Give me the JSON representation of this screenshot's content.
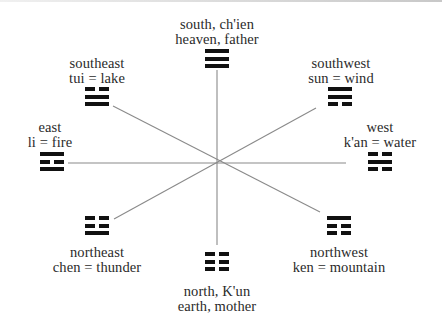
{
  "diagram": {
    "title": "",
    "center": {
      "x": 217,
      "y": 163
    },
    "line_color": "#8a8a8a",
    "trigram_color": "#111111",
    "directions": [
      {
        "id": "south",
        "line1": "south,  ch'ien",
        "line2": "heaven,  father",
        "trigram": [
          "solid",
          "solid",
          "solid"
        ]
      },
      {
        "id": "southeast",
        "line1": "southeast",
        "line2": "tui  =  lake",
        "trigram": [
          "broken",
          "solid",
          "solid"
        ]
      },
      {
        "id": "southwest",
        "line1": "southwest",
        "line2": "sun  =  wind",
        "trigram": [
          "solid",
          "solid",
          "broken"
        ]
      },
      {
        "id": "east",
        "line1": "east",
        "line2": "li  =  fire",
        "trigram": [
          "solid",
          "broken",
          "solid"
        ]
      },
      {
        "id": "west",
        "line1": "west",
        "line2": "k'an  =  water",
        "trigram": [
          "broken",
          "solid",
          "broken"
        ]
      },
      {
        "id": "northeast",
        "line1": "northeast",
        "line2": "chen  =  thunder",
        "trigram": [
          "broken",
          "broken",
          "solid"
        ]
      },
      {
        "id": "northwest",
        "line1": "northwest",
        "line2": "ken  =  mountain",
        "trigram": [
          "solid",
          "broken",
          "broken"
        ]
      },
      {
        "id": "north",
        "line1": "north,  K'un",
        "line2": "earth,  mother",
        "trigram": [
          "broken",
          "broken",
          "broken"
        ]
      }
    ]
  }
}
